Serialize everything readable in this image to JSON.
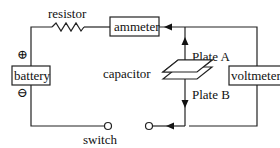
{
  "diagram": {
    "type": "circuit",
    "components": {
      "resistor": "resistor",
      "ammeter": "ammeter",
      "battery": "battery",
      "voltmeter": "voltmeter",
      "capacitor": "capacitor",
      "plate_a": "Plate A",
      "plate_b": "Plate B",
      "switch": "switch"
    },
    "symbols": {
      "plus": "⊕",
      "minus": "⊖"
    },
    "colors": {
      "line": "#222222",
      "background": "#ffffff"
    }
  }
}
